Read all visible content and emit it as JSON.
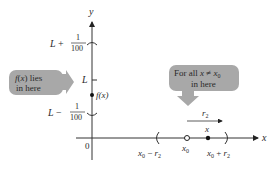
{
  "axes": {
    "y_label": "y",
    "x_label": "x",
    "origin_label": "0"
  },
  "y_ticks": {
    "upper": {
      "prefix": "L +",
      "num": "1",
      "den": "100"
    },
    "center": "L",
    "lower": {
      "prefix": "L −",
      "num": "1",
      "den": "100"
    },
    "point_label": "f(x)"
  },
  "x_ticks": {
    "left": {
      "base": "x",
      "sub": "0",
      "rest": " − r",
      "rsub": "2"
    },
    "center": {
      "base": "x",
      "sub": "0"
    },
    "right": {
      "base": "x",
      "sub": "0",
      "rest": " + r",
      "rsub": "2"
    },
    "point_label": "x"
  },
  "radius_label": {
    "base": "r",
    "sub": "2"
  },
  "callouts": {
    "left": {
      "line1": "f(x) lies",
      "line2": "in here"
    },
    "right": {
      "line1": "For all x ≠ x",
      "line1_sub": "0",
      "line2": "in here"
    }
  },
  "colors": {
    "callout_fill": "#a8a8a8",
    "axis": "#333333",
    "text": "#2a2a2a"
  }
}
